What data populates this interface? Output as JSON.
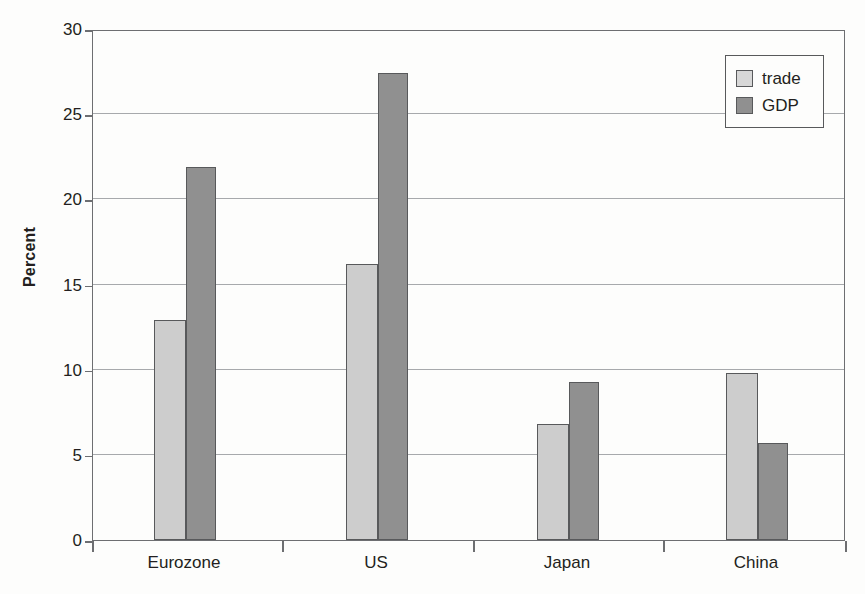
{
  "chart_data": {
    "type": "bar",
    "title": "",
    "subtitle": "",
    "xlabel": "",
    "ylabel": "Percent",
    "categories": [
      "Eurozone",
      "US",
      "Japan",
      "China"
    ],
    "series": [
      {
        "name": "trade",
        "color": "#cdcdcd",
        "values": [
          12.9,
          16.2,
          6.8,
          9.8
        ]
      },
      {
        "name": "GDP",
        "color": "#909090",
        "values": [
          21.9,
          27.4,
          9.3,
          5.7
        ]
      }
    ],
    "ylim": [
      0,
      30
    ],
    "ytick_values": [
      0,
      5,
      10,
      15,
      20,
      25,
      30
    ],
    "ytick_labels": [
      "0",
      "5",
      "10",
      "15",
      "20",
      "25",
      "30"
    ],
    "grid": "horizontal",
    "legend_position": "top-right",
    "legend_entries": [
      "trade",
      "GDP"
    ],
    "annotations": []
  },
  "axes": {
    "y_title": "Percent"
  },
  "legend": {
    "items": [
      {
        "label": "trade"
      },
      {
        "label": "GDP"
      }
    ]
  }
}
